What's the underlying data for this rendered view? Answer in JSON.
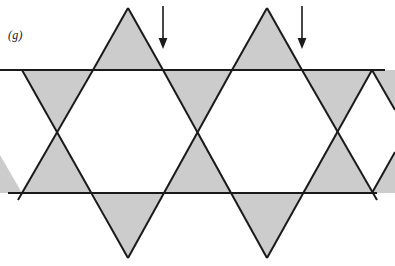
{
  "figure": {
    "label": "(g)",
    "caption_text": "(g)",
    "background_color": "#ffffff",
    "stroke_color": "#1a1a1a",
    "fill_color": "#cccccc",
    "line_width": 2,
    "width": 395,
    "height": 266
  },
  "geometry": {
    "top_line": {
      "name": "upper-horizontal-line",
      "y": 70,
      "x_start": 0,
      "x_end": 385
    },
    "bottom_line": {
      "name": "lower-horizontal-line",
      "y": 193,
      "x_start": 8,
      "x_end": 377
    },
    "band_height": 123,
    "triangle_half_width": 35,
    "triangle_height": 61,
    "hexagram_centers_x": [
      128,
      267
    ],
    "hexagram_center_y": 131,
    "upward_triangle_apexes": [
      {
        "x": 128,
        "y": 8
      },
      {
        "x": 267,
        "y": 8
      }
    ],
    "downward_triangle_apexes": [
      {
        "x": 128,
        "y": 258
      },
      {
        "x": 267,
        "y": 258
      }
    ],
    "shaded_triangles": [
      {
        "name": "top-upper-point-1",
        "points": "128,8 163,70 93,70"
      },
      {
        "name": "top-upper-point-2",
        "points": "267,8 302,70 232,70"
      },
      {
        "name": "top-edge-left-down",
        "points": "22,70 92,70 57,131"
      },
      {
        "name": "top-edge-mid-down",
        "points": "163,70 233,70 198,131"
      },
      {
        "name": "top-edge-right-down",
        "points": "302,70 372,70 337,131"
      },
      {
        "name": "bottom-edge-left-up",
        "points": "57,131 92,193 22,193"
      },
      {
        "name": "bottom-edge-mid-up",
        "points": "198,131 233,193 163,193"
      },
      {
        "name": "bottom-edge-right-up",
        "points": "337,131 372,193 302,193"
      },
      {
        "name": "bottom-lower-point-1",
        "points": "128,258 93,193 163,193"
      },
      {
        "name": "bottom-lower-point-2",
        "points": "267,258 232,193 302,193"
      }
    ],
    "hexagon_voids": [
      {
        "name": "white-hexagon-1",
        "points": "93,70 163,70 198,131 163,193 93,193 57,131"
      },
      {
        "name": "white-hexagon-2",
        "points": "232,70 302,70 337,131 302,193 232,193 198,131"
      }
    ],
    "long_strokes": [
      {
        "name": "stroke-down-right-a",
        "x1": 22,
        "y1": 70,
        "x2": 128,
        "y2": 258
      },
      {
        "name": "stroke-down-right-b",
        "x1": 163,
        "y1": 70,
        "x2": 267,
        "y2": 258
      },
      {
        "name": "stroke-down-right-c",
        "x1": 302,
        "y1": 70,
        "x2": 377,
        "y2": 196
      },
      {
        "name": "stroke-up-right-a",
        "x1": 18,
        "y1": 196,
        "x2": 93,
        "y2": 70
      },
      {
        "name": "stroke-up-right-b",
        "x1": 128,
        "y1": 258,
        "x2": 232,
        "y2": 70
      },
      {
        "name": "stroke-up-right-c",
        "x1": 267,
        "y1": 258,
        "x2": 372,
        "y2": 70
      },
      {
        "name": "stroke-apex-left-1",
        "x1": 128,
        "y1": 8,
        "x2": 93,
        "y2": 70
      },
      {
        "name": "stroke-apex-right-1",
        "x1": 128,
        "y1": 8,
        "x2": 163,
        "y2": 70
      },
      {
        "name": "stroke-apex-left-2",
        "x1": 267,
        "y1": 8,
        "x2": 232,
        "y2": 70
      },
      {
        "name": "stroke-apex-right-2",
        "x1": 267,
        "y1": 8,
        "x2": 302,
        "y2": 70
      }
    ]
  },
  "annotations": {
    "arrows": [
      {
        "name": "arrow-marker-1",
        "label": "",
        "x": 163,
        "y_start": 6,
        "y_end": 48,
        "direction": "down",
        "points_at": "vertex at x=163, y=70"
      },
      {
        "name": "arrow-marker-2",
        "label": "",
        "x": 302,
        "y_start": 6,
        "y_end": 48,
        "direction": "down",
        "points_at": "vertex at x=302, y=70"
      }
    ],
    "arrow_count": 2,
    "arrow_color": "#1a1a1a"
  }
}
